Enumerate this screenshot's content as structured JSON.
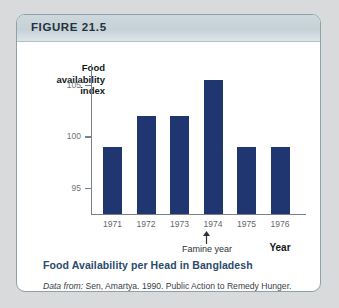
{
  "figure": {
    "header_label": "FIGURE 21.5",
    "caption_title": "Food Availability per Head in Bangladesh",
    "source_prefix": "Data from:",
    "source_text": " Sen, Amartya. 1990. Public Action to Remedy Hunger. Arturo Tanco Memorial Lecture given in London on August 25, 1990."
  },
  "colors": {
    "bar": "#1f3670",
    "caption_title": "#2a4a6b",
    "header_band": "#c8d4da",
    "box_border": "#8fa0a8",
    "page_background": "#d9dadb"
  },
  "chart_data": {
    "type": "bar",
    "title": "Food Availability per Head in Bangladesh",
    "xlabel": "Year",
    "ylabel": "Food availability index",
    "categories": [
      "1971",
      "1972",
      "1973",
      "1974",
      "1975",
      "1976"
    ],
    "values": [
      99,
      102,
      102,
      105.5,
      99,
      99
    ],
    "ylim": [
      92.5,
      107
    ],
    "yticks": [
      95,
      100,
      105
    ],
    "ytick_labels": [
      "95",
      "100",
      "105"
    ],
    "grid": false,
    "legend": null,
    "annotations": [
      {
        "text": "Famine year",
        "points_to": "1974",
        "arrow": "up"
      }
    ]
  }
}
